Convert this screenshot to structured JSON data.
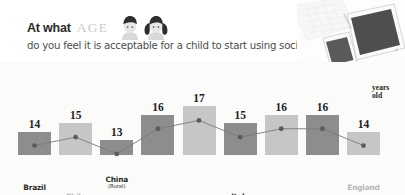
{
  "header": {
    "title_main": "At what",
    "title_accent": "AGE",
    "subtitle": "do you feel it is acceptable for a child to start using social media?",
    "icons": {
      "boy": "boy-avatar-icon",
      "girl": "girl-avatar-icon",
      "devices": "devices-photo-tablet-phone-laptop"
    }
  },
  "annotation": {
    "years_old_line1": "years",
    "years_old_line2": "old"
  },
  "colors": {
    "bar_dark": "#8d8d8d",
    "bar_light": "#c6c6c6",
    "label_dark": "#2b2b2b",
    "label_light": "#b6b6b6",
    "value_text": "#1f1f1f",
    "line": "#7a7a7a",
    "marker": "#5c5c5c",
    "title_accent": "#c9c9c9",
    "background": "#fbfbf9"
  },
  "chart_data": {
    "type": "bar",
    "xlabel": "",
    "ylabel": "years old",
    "ylim": [
      0,
      18
    ],
    "grid": false,
    "legend": "none",
    "categories": [
      "Brazil",
      "Chile",
      "China",
      "China",
      "India",
      "Italy",
      "Trinidad",
      "Turkey",
      "England"
    ],
    "category_subs": [
      "",
      "(North)",
      "(Rural)",
      "(Industrial)",
      "(South)",
      "",
      "",
      "(S.E)",
      ""
    ],
    "values": [
      14,
      15,
      13,
      16,
      17,
      15,
      16,
      16,
      14
    ],
    "bars": [
      {
        "label": "Brazil",
        "sub": "",
        "value": 14,
        "tone": "dark"
      },
      {
        "label": "Chile",
        "sub": "(North)",
        "value": 15,
        "tone": "light"
      },
      {
        "label": "China",
        "sub": "(Rural)",
        "value": 13,
        "tone": "dark"
      },
      {
        "label": "China",
        "sub": "(Industrial)",
        "value": 16,
        "tone": "dark"
      },
      {
        "label": "India",
        "sub": "(South)",
        "value": 17,
        "tone": "light"
      },
      {
        "label": "Italy",
        "sub": "",
        "value": 15,
        "tone": "dark"
      },
      {
        "label": "Trinidad",
        "sub": "",
        "value": 16,
        "tone": "light"
      },
      {
        "label": "Turkey",
        "sub": "(S.E)",
        "value": 16,
        "tone": "dark"
      },
      {
        "label": "England",
        "sub": "",
        "value": 14,
        "tone": "light"
      }
    ],
    "overlay_line": {
      "type": "line",
      "values": [
        14,
        15,
        13,
        16,
        17,
        15,
        16,
        16,
        14
      ],
      "markers": true
    }
  }
}
